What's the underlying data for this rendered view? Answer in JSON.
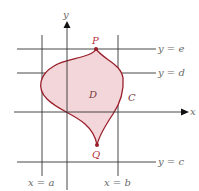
{
  "figure": {
    "axes": {
      "x_label": "x",
      "y_label": "y"
    },
    "lines": {
      "x_a": "x = a",
      "x_b": "x = b",
      "y_c": "y = c",
      "y_d": "y = d",
      "y_e": "y = e"
    },
    "points": {
      "top": "P",
      "bottom": "Q"
    },
    "region": {
      "label": "D",
      "boundary_label": "C"
    },
    "colors": {
      "region_fill": "#f3d6d9",
      "boundary": "#9a1f2b",
      "point": "#9a1f2b",
      "grid_line": "#333333"
    }
  }
}
